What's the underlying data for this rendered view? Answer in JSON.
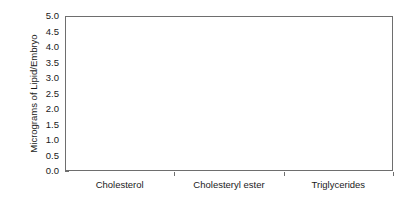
{
  "chart_data": {
    "type": "bar",
    "title": "",
    "subtitle": "",
    "xlabel": "",
    "ylabel": "Micrograms of Lipid/Embryo",
    "categories": [
      "Cholesterol",
      "Cholesteryl ester",
      "Triglycerides"
    ],
    "ylim": [
      0.0,
      5.0
    ],
    "ytick_labels": [
      "0.0",
      "0.5",
      "1.0",
      "1.5",
      "2.0",
      "2.5",
      "3.0",
      "3.5",
      "4.0",
      "4.5",
      "5.0"
    ],
    "ytick_values": [
      0.0,
      0.5,
      1.0,
      1.5,
      2.0,
      2.5,
      3.0,
      3.5,
      4.0,
      4.5,
      5.0
    ],
    "grid": false,
    "legend": "none",
    "series": [
      {
        "name": "filled",
        "fill": "#000000",
        "values": [
          4.25,
          1.07,
          0.35
        ],
        "errors": [
          0.4,
          0.12,
          0.06
        ]
      },
      {
        "name": "open",
        "fill": "#ffffff",
        "values": [
          2.8,
          0.29,
          0.32
        ],
        "errors": [
          0.22,
          0.06,
          0.05
        ]
      }
    ]
  },
  "figure": {
    "background": "#ffffff",
    "frame_color": "#6e6e6e",
    "text_color": "#1a1a1a"
  }
}
